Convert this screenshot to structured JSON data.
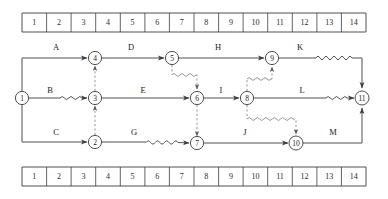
{
  "diagram": {
    "colors": {
      "line": "#3c3c3c",
      "dashed": "#8a8a8a",
      "text": "#1a1a1a",
      "background": "#ffffff"
    },
    "top_ruler": {
      "name": "time-scale-ruler-top",
      "ticks": [
        "1",
        "2",
        "3",
        "4",
        "5",
        "6",
        "7",
        "8",
        "9",
        "10",
        "11",
        "12",
        "13",
        "14"
      ]
    },
    "bottom_ruler": {
      "name": "time-scale-ruler-bottom",
      "ticks": [
        "1",
        "2",
        "3",
        "4",
        "5",
        "6",
        "7",
        "8",
        "9",
        "10",
        "11",
        "12",
        "13",
        "14"
      ]
    },
    "nodes": [
      {
        "id": "1",
        "label": "1",
        "x": 22,
        "y": 98
      },
      {
        "id": "2",
        "label": "2",
        "x": 95,
        "y": 142
      },
      {
        "id": "3",
        "label": "3",
        "x": 95,
        "y": 98
      },
      {
        "id": "4",
        "label": "4",
        "x": 95,
        "y": 58
      },
      {
        "id": "5",
        "label": "5",
        "x": 172,
        "y": 58
      },
      {
        "id": "6",
        "label": "6",
        "x": 197,
        "y": 98
      },
      {
        "id": "7",
        "label": "7",
        "x": 197,
        "y": 143
      },
      {
        "id": "8",
        "label": "8",
        "x": 247,
        "y": 98
      },
      {
        "id": "9",
        "label": "9",
        "x": 272,
        "y": 58
      },
      {
        "id": "10",
        "label": "10",
        "x": 296,
        "y": 143
      },
      {
        "id": "11",
        "label": "11",
        "x": 362,
        "y": 98
      }
    ],
    "activities": [
      {
        "label": "A",
        "from": "1",
        "to": "4",
        "x": 56,
        "y": 47
      },
      {
        "label": "B",
        "from": "1",
        "to": "3",
        "x": 50,
        "y": 90
      },
      {
        "label": "C",
        "from": "1",
        "to": "2",
        "x": 56,
        "y": 132
      },
      {
        "label": "D",
        "from": "4",
        "to": "5",
        "x": 131,
        "y": 47
      },
      {
        "label": "E",
        "from": "3",
        "to": "6",
        "x": 143,
        "y": 90
      },
      {
        "label": "G",
        "from": "2",
        "to": "7",
        "x": 134,
        "y": 132
      },
      {
        "label": "H",
        "from": "5",
        "to": "9",
        "x": 218,
        "y": 47
      },
      {
        "label": "I",
        "from": "6",
        "to": "8",
        "x": 221,
        "y": 90
      },
      {
        "label": "J",
        "from": "7",
        "to": "10",
        "x": 245,
        "y": 132
      },
      {
        "label": "K",
        "from": "9",
        "to": "11",
        "x": 300,
        "y": 47
      },
      {
        "label": "L",
        "from": "8",
        "to": "11",
        "x": 302,
        "y": 90
      },
      {
        "label": "M",
        "from": "10",
        "to": "11",
        "x": 333,
        "y": 132
      }
    ],
    "dummies": [
      {
        "name": "dummy-3-to-4",
        "from": "3",
        "to": "4"
      },
      {
        "name": "dummy-2-to-3",
        "from": "2",
        "to": "3"
      },
      {
        "name": "dummy-5-to-6",
        "from": "5",
        "to": "6"
      },
      {
        "name": "dummy-6-to-7",
        "from": "6",
        "to": "7"
      },
      {
        "name": "dummy-8-to-9",
        "from": "8",
        "to": "9"
      },
      {
        "name": "dummy-8-to-10",
        "from": "8",
        "to": "10"
      }
    ]
  }
}
